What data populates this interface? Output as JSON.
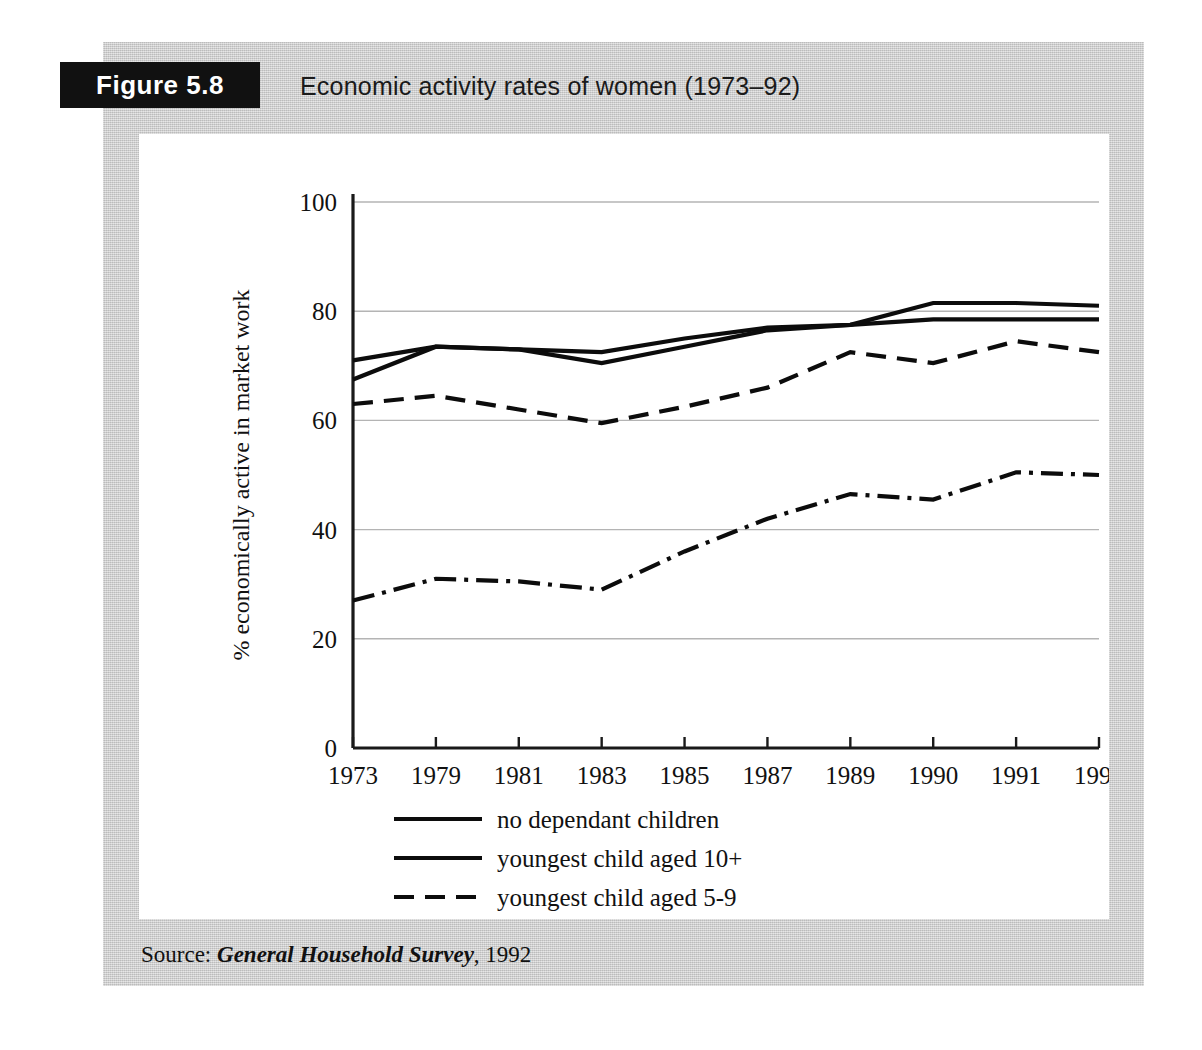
{
  "figure": {
    "tag": "Figure 5.8",
    "title": "Economic activity rates of women (1973–92)",
    "source_label": "Source:",
    "source_title": "General Household Survey",
    "source_year": ", 1992"
  },
  "colors": {
    "plate_background": "#c9c9c9",
    "canvas_background": "#ffffff",
    "tag_background": "#111111",
    "tag_text": "#ffffff",
    "ink": "#111111",
    "gridline": "#b4b4b4"
  },
  "chart_data": {
    "type": "line",
    "title": "Economic activity rates of women (1973–92)",
    "xlabel": "",
    "ylabel": "% economically active in market work",
    "categories": [
      "1973",
      "1979",
      "1981",
      "1983",
      "1985",
      "1987",
      "1989",
      "1990",
      "1991",
      "1992"
    ],
    "x_tick_labels": [
      "1973",
      "1979",
      "1981",
      "1983",
      "1985",
      "1987",
      "1989",
      "1990",
      "1991",
      "1992"
    ],
    "y_tick_labels": [
      "0",
      "20",
      "40",
      "60",
      "80",
      "100"
    ],
    "y_ticks": [
      0,
      20,
      40,
      60,
      80,
      100
    ],
    "ylim": [
      0,
      100
    ],
    "grid": "horizontal",
    "legend_position": "below-plot-left",
    "series": [
      {
        "name": "no dependant children",
        "dash": "solid",
        "values": [
          71.0,
          73.5,
          73.0,
          72.5,
          75.0,
          77.0,
          77.5,
          78.5,
          78.5,
          78.5
        ]
      },
      {
        "name": "youngest child aged 10+",
        "dash": "solid",
        "values": [
          67.5,
          73.5,
          73.0,
          70.5,
          73.5,
          76.5,
          77.5,
          81.5,
          81.5,
          81.0
        ]
      },
      {
        "name": "youngest child aged 5-9",
        "dash": "dashed",
        "values": [
          63.0,
          64.5,
          62.0,
          59.5,
          62.5,
          66.0,
          72.5,
          70.5,
          74.5,
          72.5
        ]
      },
      {
        "name": "youngest child aged 0-4",
        "dash": "dash-dot",
        "values": [
          27.0,
          31.0,
          30.5,
          29.0,
          36.0,
          42.0,
          46.5,
          45.5,
          50.5,
          50.0
        ]
      }
    ]
  },
  "legend": {
    "items": [
      {
        "label": "no dependant children",
        "dash": "solid"
      },
      {
        "label": "youngest child aged 10+",
        "dash": "solid"
      },
      {
        "label": "youngest child aged 5-9",
        "dash": "dashed"
      },
      {
        "label": "youngest child aged 0-4",
        "dash": "dash-dot"
      }
    ]
  }
}
